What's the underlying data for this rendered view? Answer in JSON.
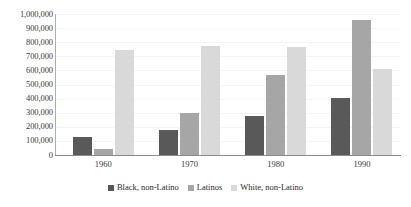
{
  "chart_data": {
    "type": "bar",
    "title": "",
    "subtitle": "",
    "xlabel": "",
    "ylabel": "",
    "categories": [
      "1960",
      "1970",
      "1980",
      "1990"
    ],
    "series": [
      {
        "name": "Black, non-Latino",
        "color": "#595959",
        "values": [
          130000,
          180000,
          275000,
          405000
        ]
      },
      {
        "name": "Latinos",
        "color": "#a6a6a6",
        "values": [
          45000,
          295000,
          570000,
          955000
        ]
      },
      {
        "name": "White, non-Latino",
        "color": "#d9d9d9",
        "values": [
          745000,
          775000,
          765000,
          610000
        ]
      }
    ],
    "ylim": [
      0,
      1000000
    ],
    "ytick_step": 100000,
    "ytick_labels": [
      "1,000,000",
      "900,000",
      "800,000",
      "700,000",
      "600,000",
      "500,000",
      "400,000",
      "300,000",
      "200,000",
      "100,000",
      "0"
    ],
    "grid": true,
    "legend_position": "bottom"
  },
  "legend": {
    "items": [
      {
        "label": "Black, non-Latino"
      },
      {
        "label": "Latinos"
      },
      {
        "label": "White, non-Latino"
      }
    ]
  }
}
